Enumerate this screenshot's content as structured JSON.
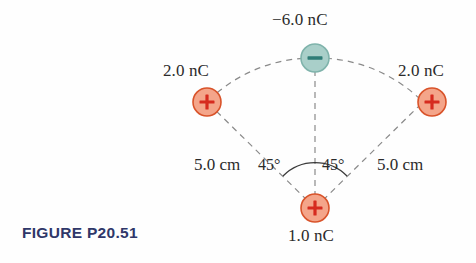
{
  "figure": {
    "caption": "FIGURE P20.51",
    "caption_color": "#2f3769",
    "background_color": "#fefefe"
  },
  "colors": {
    "positive_fill": "#f4a58a",
    "positive_stroke": "#d9532a",
    "positive_sign": "#d62b1f",
    "negative_fill": "#a9cfc9",
    "negative_stroke": "#7fb3ab",
    "negative_sign": "#2f7d77",
    "dashed_line": "#8a8a8a",
    "arc_line": "#3a3a3a",
    "text": "#2b2b2b"
  },
  "charges": [
    {
      "id": "charge-top-negative",
      "label": "−6.0 nC",
      "sign": "−",
      "polarity": "negative",
      "cx": 315,
      "cy": 58,
      "r": 14,
      "label_x": 272,
      "label_y": 10
    },
    {
      "id": "charge-left-positive",
      "label": "2.0 nC",
      "sign": "+",
      "polarity": "positive",
      "cx": 207,
      "cy": 102,
      "r": 14,
      "label_x": 163,
      "label_y": 61
    },
    {
      "id": "charge-right-positive",
      "label": "2.0 nC",
      "sign": "+",
      "polarity": "positive",
      "cx": 432,
      "cy": 102,
      "r": 14,
      "label_x": 398,
      "label_y": 61
    },
    {
      "id": "charge-bottom-positive",
      "label": "1.0 nC",
      "sign": "+",
      "polarity": "positive",
      "cx": 315,
      "cy": 208,
      "r": 14,
      "label_x": 288,
      "label_y": 226
    }
  ],
  "dimensions": [
    {
      "id": "distance-left",
      "label": "5.0 cm",
      "x": 194,
      "y": 155
    },
    {
      "id": "distance-right",
      "label": "5.0 cm",
      "x": 377,
      "y": 155
    }
  ],
  "angles": [
    {
      "id": "angle-left",
      "label": "45°",
      "x": 258,
      "y": 156
    },
    {
      "id": "angle-right",
      "label": "45°",
      "x": 322,
      "y": 156
    }
  ],
  "geometry": {
    "apex_x": 315,
    "apex_y": 208,
    "radius_px": 150,
    "angle_deg": 45,
    "arc_marker_radius": 45,
    "dash_pattern": "6 5",
    "dash_width": 1.2
  }
}
